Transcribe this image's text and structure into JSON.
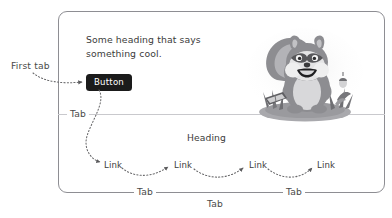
{
  "page": {
    "frame_color": "#8e8e93",
    "divider_color": "#c9c9cd",
    "background": "#ffffff",
    "annotation_color": "#4a4a4a",
    "text_color": "#3b3b3b"
  },
  "hero": {
    "heading": "Some heading that says something cool.",
    "button_label": "Button",
    "button_bg": "#1b1b1b",
    "button_text_color": "#ffffff"
  },
  "illustration": {
    "name": "squirrel-mascot",
    "description": "grayscale cartoon squirrel sitting on a mound holding an open book",
    "palette": {
      "dark": "#6f6f72",
      "mid": "#9a9a9d",
      "light": "#c6c6c8",
      "pale": "#e2e2e3",
      "outline": "#4a4a4c"
    }
  },
  "content": {
    "section_heading": "Heading",
    "links": [
      {
        "label": "Link"
      },
      {
        "label": "Link"
      },
      {
        "label": "Link"
      },
      {
        "label": "Link"
      }
    ]
  },
  "annotations": {
    "first_tab": "First tab",
    "tab_divider": "Tab",
    "tab_bottom_left": "Tab",
    "tab_bottom_right": "Tab",
    "tab_outside": "Tab"
  }
}
